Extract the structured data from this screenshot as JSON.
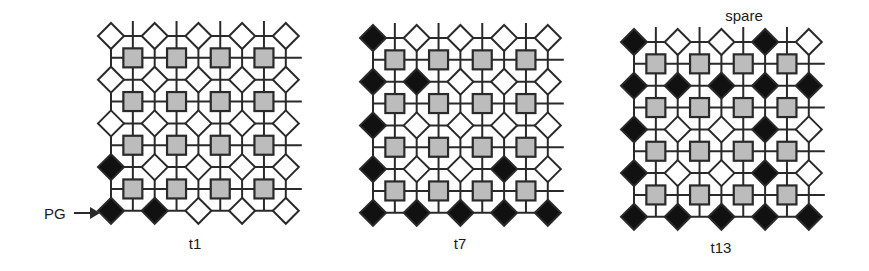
{
  "colors": {
    "line": "#2a2a2a",
    "filled_node": "#111111",
    "empty_node": "#ffffff",
    "square_fill": "#bcbcbc",
    "square_border": "#2a2a2a",
    "text": "#1a1a1a"
  },
  "legend": {
    "pg_label": "PG",
    "spare_label": "spare"
  },
  "panels": [
    {
      "label": "t1",
      "origin": [
        111,
        36
      ],
      "label_pos": [
        195,
        236
      ],
      "filled": [
        [
          0,
          0,
          0,
          0,
          0
        ],
        [
          0,
          0,
          0,
          0,
          0
        ],
        [
          0,
          0,
          0,
          0,
          0
        ],
        [
          1,
          0,
          0,
          0,
          0
        ],
        [
          1,
          1,
          0,
          0,
          0
        ]
      ]
    },
    {
      "label": "t7",
      "origin": [
        373,
        38
      ],
      "label_pos": [
        460,
        236
      ],
      "filled": [
        [
          1,
          0,
          0,
          0,
          0
        ],
        [
          1,
          1,
          0,
          0,
          0
        ],
        [
          1,
          0,
          0,
          0,
          0
        ],
        [
          1,
          0,
          0,
          1,
          0
        ],
        [
          1,
          1,
          1,
          1,
          1
        ]
      ]
    },
    {
      "label": "t13",
      "origin": [
        634,
        42
      ],
      "label_pos": [
        721,
        240
      ],
      "spare_pos": [
        744,
        8
      ],
      "filled": [
        [
          1,
          0,
          0,
          1,
          0
        ],
        [
          1,
          1,
          1,
          1,
          1
        ],
        [
          1,
          0,
          0,
          1,
          0
        ],
        [
          1,
          0,
          0,
          1,
          0
        ],
        [
          1,
          1,
          1,
          1,
          1
        ]
      ]
    }
  ],
  "grid": {
    "diamond_rows": 5,
    "diamond_cols": 5,
    "square_rows": 4,
    "square_cols": 4,
    "pitch": 43.7,
    "diamond_half": 13,
    "square_size": 19
  }
}
